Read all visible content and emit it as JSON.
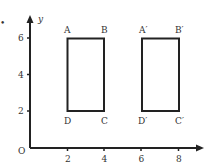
{
  "figure": {
    "marker": "•",
    "origin_label": "O",
    "y_axis_label": "y",
    "x_ticks": [
      {
        "value": 2,
        "label": "2"
      },
      {
        "value": 4,
        "label": "4"
      },
      {
        "value": 6,
        "label": "6"
      },
      {
        "value": 8,
        "label": "8"
      }
    ],
    "y_ticks": [
      {
        "value": 2,
        "label": "2"
      },
      {
        "value": 4,
        "label": "4"
      },
      {
        "value": 6,
        "label": "6"
      }
    ],
    "shapes": [
      {
        "name": "ABCD",
        "points": [
          {
            "label": "A",
            "x": 2,
            "y": 6
          },
          {
            "label": "B",
            "x": 4,
            "y": 6
          },
          {
            "label": "C",
            "x": 4,
            "y": 2
          },
          {
            "label": "D",
            "x": 2,
            "y": 2
          }
        ]
      },
      {
        "name": "A'B'C'D'",
        "points": [
          {
            "label": "A′",
            "x": 6,
            "y": 6
          },
          {
            "label": "B′",
            "x": 8,
            "y": 6
          },
          {
            "label": "C′",
            "x": 8,
            "y": 2
          },
          {
            "label": "D′",
            "x": 6,
            "y": 2
          }
        ]
      }
    ],
    "colors": {
      "line": "#222222",
      "text": "#333333",
      "background": "#ffffff"
    }
  }
}
